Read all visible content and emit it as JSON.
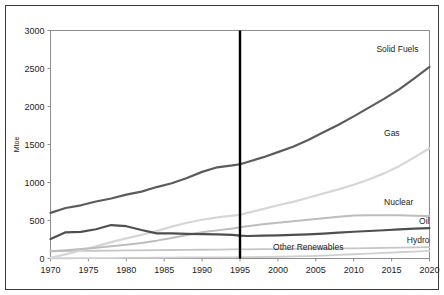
{
  "figure": {
    "frame_color": "#3a3a3a",
    "background": "#ffffff"
  },
  "chart_data": {
    "type": "line",
    "title": "",
    "subtitle": "",
    "xlabel": "",
    "ylabel": "Mtoe",
    "xlim": [
      1970,
      2020
    ],
    "ylim": [
      0,
      3000
    ],
    "xticks": [
      1970,
      1975,
      1980,
      1985,
      1990,
      1995,
      2000,
      2005,
      2010,
      2015,
      2020
    ],
    "yticks": [
      0,
      500,
      1000,
      1500,
      2000,
      2500,
      3000
    ],
    "xtick_labels": [
      "1970",
      "1975",
      "1980",
      "1985",
      "1990",
      "1995",
      "2000",
      "2005",
      "2010",
      "2015",
      "2020"
    ],
    "ytick_labels": [
      "0",
      "500",
      "1000",
      "1500",
      "2000",
      "2500",
      "3000"
    ],
    "grid": false,
    "legend_position": "inline-right-labels",
    "annotations": [
      {
        "name": "historical-projection-divider",
        "type": "vertical-line",
        "x": 1995,
        "color": "#000000",
        "label": ""
      }
    ],
    "x": [
      1970,
      1972,
      1974,
      1976,
      1978,
      1980,
      1982,
      1984,
      1986,
      1988,
      1990,
      1992,
      1994,
      1995,
      1996,
      1998,
      2000,
      2002,
      2004,
      2006,
      2008,
      2010,
      2012,
      2014,
      2016,
      2018,
      2020
    ],
    "series": [
      {
        "name": "Solid Fuels",
        "label": "Solid Fuels",
        "color": "#5c5c5c",
        "width": 2.2,
        "values": [
          600,
          665,
          700,
          750,
          790,
          840,
          880,
          940,
          990,
          1060,
          1140,
          1200,
          1225,
          1240,
          1270,
          1330,
          1400,
          1470,
          1560,
          1660,
          1760,
          1870,
          1985,
          2100,
          2225,
          2370,
          2520
        ]
      },
      {
        "name": "Gas",
        "label": "Gas",
        "color": "#d6d6d6",
        "width": 2.2,
        "values": [
          10,
          55,
          105,
          160,
          215,
          265,
          310,
          360,
          420,
          470,
          510,
          540,
          565,
          575,
          600,
          650,
          700,
          745,
          800,
          855,
          910,
          970,
          1040,
          1120,
          1215,
          1330,
          1450
        ]
      },
      {
        "name": "Nuclear",
        "label": "Nuclear",
        "color": "#bdbdbd",
        "width": 2.0,
        "values": [
          95,
          110,
          125,
          140,
          160,
          180,
          205,
          235,
          270,
          310,
          345,
          370,
          395,
          410,
          425,
          450,
          470,
          490,
          510,
          530,
          550,
          565,
          570,
          570,
          568,
          563,
          558
        ]
      },
      {
        "name": "Oil",
        "label": "Oil",
        "color": "#4f4f4f",
        "width": 2.2,
        "values": [
          255,
          345,
          350,
          385,
          440,
          425,
          375,
          330,
          330,
          325,
          322,
          318,
          312,
          300,
          296,
          300,
          305,
          310,
          318,
          328,
          340,
          352,
          362,
          372,
          382,
          392,
          400
        ]
      },
      {
        "name": "Hydro",
        "label": "Hydro",
        "color": "#c6c6c6",
        "width": 1.8,
        "values": [
          95,
          98,
          100,
          102,
          104,
          106,
          108,
          110,
          112,
          113,
          115,
          117,
          119,
          120,
          121,
          123,
          124,
          126,
          128,
          130,
          132,
          134,
          137,
          140,
          143,
          146,
          150
        ]
      },
      {
        "name": "Other Renewables",
        "label": "Other Renewables",
        "color": "#cfcfcf",
        "width": 1.8,
        "values": [
          2,
          3,
          4,
          5,
          6,
          7,
          8,
          10,
          12,
          13,
          14,
          15,
          16,
          17,
          18,
          20,
          23,
          27,
          32,
          39,
          47,
          56,
          65,
          74,
          82,
          91,
          100
        ]
      }
    ],
    "series_label_positions": [
      {
        "name": "Solid Fuels",
        "x": 2013,
        "y": 2720,
        "anchor": "start"
      },
      {
        "name": "Gas",
        "x": 2014,
        "y": 1610,
        "anchor": "start"
      },
      {
        "name": "Nuclear",
        "x": 2014,
        "y": 710,
        "anchor": "start"
      },
      {
        "name": "Oil",
        "x": 2020,
        "y": 460,
        "anchor": "end"
      },
      {
        "name": "Hydro",
        "x": 2020,
        "y": 205,
        "anchor": "end"
      },
      {
        "name": "Other Renewables",
        "x": 2004,
        "y": 108,
        "anchor": "middle"
      }
    ]
  }
}
